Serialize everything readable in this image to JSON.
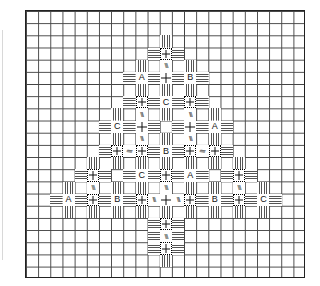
{
  "figure": {
    "grid": {
      "columns": 23,
      "rows": 22
    },
    "legend_types": {
      "vb": "vertical-bars",
      "hb": "horizontal-bars",
      "dx": "dotted-cross",
      "px": "plus",
      "dg": "diagonal-stitch",
      "sd": "sideways-diagonal-stitch",
      "A": "letter-A",
      "B": "letter-B",
      "C": "letter-C"
    },
    "glyphs": {
      "dg": "\\\\\\",
      "sd": "\\\\\\"
    },
    "cells": [
      {
        "r": 2,
        "c": 11,
        "t": "vb"
      },
      {
        "r": 3,
        "c": 10,
        "t": "hb"
      },
      {
        "r": 3,
        "c": 11,
        "t": "dx"
      },
      {
        "r": 3,
        "c": 12,
        "t": "hb"
      },
      {
        "r": 4,
        "c": 9,
        "t": "vb"
      },
      {
        "r": 4,
        "c": 11,
        "t": "dg"
      },
      {
        "r": 4,
        "c": 13,
        "t": "vb"
      },
      {
        "r": 5,
        "c": 8,
        "t": "hb"
      },
      {
        "r": 5,
        "c": 9,
        "t": "A"
      },
      {
        "r": 5,
        "c": 10,
        "t": "hb"
      },
      {
        "r": 5,
        "c": 11,
        "t": "px"
      },
      {
        "r": 5,
        "c": 12,
        "t": "hb"
      },
      {
        "r": 5,
        "c": 13,
        "t": "B"
      },
      {
        "r": 5,
        "c": 14,
        "t": "hb"
      },
      {
        "r": 6,
        "c": 9,
        "t": "vb"
      },
      {
        "r": 6,
        "c": 11,
        "t": "vb"
      },
      {
        "r": 6,
        "c": 13,
        "t": "vb"
      },
      {
        "r": 7,
        "c": 8,
        "t": "hb"
      },
      {
        "r": 7,
        "c": 9,
        "t": "dx"
      },
      {
        "r": 7,
        "c": 10,
        "t": "hb"
      },
      {
        "r": 7,
        "c": 11,
        "t": "C"
      },
      {
        "r": 7,
        "c": 12,
        "t": "hb"
      },
      {
        "r": 7,
        "c": 13,
        "t": "dx"
      },
      {
        "r": 7,
        "c": 14,
        "t": "hb"
      },
      {
        "r": 8,
        "c": 7,
        "t": "vb"
      },
      {
        "r": 8,
        "c": 9,
        "t": "dg"
      },
      {
        "r": 8,
        "c": 11,
        "t": "vb"
      },
      {
        "r": 8,
        "c": 13,
        "t": "dg"
      },
      {
        "r": 8,
        "c": 15,
        "t": "vb"
      },
      {
        "r": 9,
        "c": 6,
        "t": "hb"
      },
      {
        "r": 9,
        "c": 7,
        "t": "C"
      },
      {
        "r": 9,
        "c": 8,
        "t": "hb"
      },
      {
        "r": 9,
        "c": 9,
        "t": "px"
      },
      {
        "r": 9,
        "c": 10,
        "t": "hb"
      },
      {
        "r": 9,
        "c": 12,
        "t": "hb"
      },
      {
        "r": 9,
        "c": 13,
        "t": "px"
      },
      {
        "r": 9,
        "c": 14,
        "t": "hb"
      },
      {
        "r": 9,
        "c": 15,
        "t": "A"
      },
      {
        "r": 9,
        "c": 16,
        "t": "hb"
      },
      {
        "r": 10,
        "c": 7,
        "t": "vb"
      },
      {
        "r": 10,
        "c": 9,
        "t": "dg"
      },
      {
        "r": 10,
        "c": 11,
        "t": "vb"
      },
      {
        "r": 10,
        "c": 13,
        "t": "dg"
      },
      {
        "r": 10,
        "c": 15,
        "t": "vb"
      },
      {
        "r": 11,
        "c": 6,
        "t": "hb"
      },
      {
        "r": 11,
        "c": 7,
        "t": "dx"
      },
      {
        "r": 11,
        "c": 8,
        "t": "sd"
      },
      {
        "r": 11,
        "c": 9,
        "t": "dx"
      },
      {
        "r": 11,
        "c": 10,
        "t": "hb"
      },
      {
        "r": 11,
        "c": 11,
        "t": "B"
      },
      {
        "r": 11,
        "c": 12,
        "t": "hb"
      },
      {
        "r": 11,
        "c": 13,
        "t": "dx"
      },
      {
        "r": 11,
        "c": 14,
        "t": "sd"
      },
      {
        "r": 11,
        "c": 15,
        "t": "dx"
      },
      {
        "r": 11,
        "c": 16,
        "t": "hb"
      },
      {
        "r": 12,
        "c": 5,
        "t": "vb"
      },
      {
        "r": 12,
        "c": 7,
        "t": "vb"
      },
      {
        "r": 12,
        "c": 9,
        "t": "vb"
      },
      {
        "r": 12,
        "c": 11,
        "t": "vb"
      },
      {
        "r": 12,
        "c": 13,
        "t": "vb"
      },
      {
        "r": 12,
        "c": 15,
        "t": "vb"
      },
      {
        "r": 12,
        "c": 17,
        "t": "vb"
      },
      {
        "r": 13,
        "c": 4,
        "t": "hb"
      },
      {
        "r": 13,
        "c": 5,
        "t": "dx"
      },
      {
        "r": 13,
        "c": 6,
        "t": "hb"
      },
      {
        "r": 13,
        "c": 8,
        "t": "hb"
      },
      {
        "r": 13,
        "c": 9,
        "t": "C"
      },
      {
        "r": 13,
        "c": 10,
        "t": "hb"
      },
      {
        "r": 13,
        "c": 11,
        "t": "dx"
      },
      {
        "r": 13,
        "c": 12,
        "t": "hb"
      },
      {
        "r": 13,
        "c": 13,
        "t": "A"
      },
      {
        "r": 13,
        "c": 14,
        "t": "hb"
      },
      {
        "r": 13,
        "c": 16,
        "t": "hb"
      },
      {
        "r": 13,
        "c": 17,
        "t": "dx"
      },
      {
        "r": 13,
        "c": 18,
        "t": "hb"
      },
      {
        "r": 14,
        "c": 3,
        "t": "vb"
      },
      {
        "r": 14,
        "c": 5,
        "t": "dg"
      },
      {
        "r": 14,
        "c": 7,
        "t": "vb"
      },
      {
        "r": 14,
        "c": 9,
        "t": "vb"
      },
      {
        "r": 14,
        "c": 11,
        "t": "dg"
      },
      {
        "r": 14,
        "c": 13,
        "t": "vb"
      },
      {
        "r": 14,
        "c": 15,
        "t": "vb"
      },
      {
        "r": 14,
        "c": 17,
        "t": "dg"
      },
      {
        "r": 14,
        "c": 19,
        "t": "vb"
      },
      {
        "r": 15,
        "c": 2,
        "t": "hb"
      },
      {
        "r": 15,
        "c": 3,
        "t": "A"
      },
      {
        "r": 15,
        "c": 4,
        "t": "hb"
      },
      {
        "r": 15,
        "c": 5,
        "t": "dx"
      },
      {
        "r": 15,
        "c": 6,
        "t": "hb"
      },
      {
        "r": 15,
        "c": 7,
        "t": "B"
      },
      {
        "r": 15,
        "c": 8,
        "t": "hb"
      },
      {
        "r": 15,
        "c": 9,
        "t": "dx"
      },
      {
        "r": 15,
        "c": 10,
        "t": "dg"
      },
      {
        "r": 15,
        "c": 11,
        "t": "px"
      },
      {
        "r": 15,
        "c": 12,
        "t": "dg"
      },
      {
        "r": 15,
        "c": 13,
        "t": "dx"
      },
      {
        "r": 15,
        "c": 14,
        "t": "hb"
      },
      {
        "r": 15,
        "c": 15,
        "t": "B"
      },
      {
        "r": 15,
        "c": 16,
        "t": "hb"
      },
      {
        "r": 15,
        "c": 17,
        "t": "dx"
      },
      {
        "r": 15,
        "c": 18,
        "t": "hb"
      },
      {
        "r": 15,
        "c": 19,
        "t": "C"
      },
      {
        "r": 15,
        "c": 20,
        "t": "hb"
      },
      {
        "r": 16,
        "c": 3,
        "t": "vb"
      },
      {
        "r": 16,
        "c": 5,
        "t": "vb"
      },
      {
        "r": 16,
        "c": 7,
        "t": "vb"
      },
      {
        "r": 16,
        "c": 9,
        "t": "vb"
      },
      {
        "r": 16,
        "c": 11,
        "t": "vb"
      },
      {
        "r": 16,
        "c": 13,
        "t": "vb"
      },
      {
        "r": 16,
        "c": 15,
        "t": "vb"
      },
      {
        "r": 16,
        "c": 17,
        "t": "vb"
      },
      {
        "r": 16,
        "c": 19,
        "t": "vb"
      },
      {
        "r": 17,
        "c": 10,
        "t": "hb"
      },
      {
        "r": 17,
        "c": 11,
        "t": "dx"
      },
      {
        "r": 17,
        "c": 12,
        "t": "hb"
      },
      {
        "r": 18,
        "c": 10,
        "t": "hb"
      },
      {
        "r": 18,
        "c": 11,
        "t": "dg"
      },
      {
        "r": 18,
        "c": 12,
        "t": "hb"
      },
      {
        "r": 19,
        "c": 10,
        "t": "hb"
      },
      {
        "r": 19,
        "c": 11,
        "t": "dx"
      },
      {
        "r": 19,
        "c": 12,
        "t": "hb"
      },
      {
        "r": 20,
        "c": 11,
        "t": "vb"
      }
    ]
  }
}
